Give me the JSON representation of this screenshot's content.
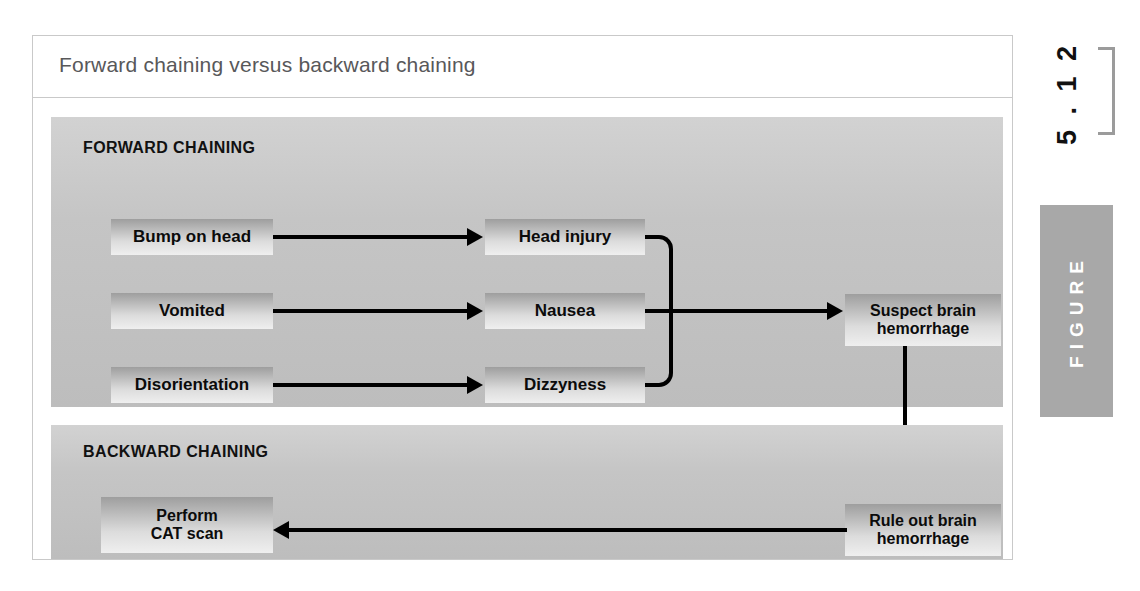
{
  "figure": {
    "caption": "Forward chaining versus backward chaining",
    "number_label": "5 . 1 2",
    "tab_label": "FIGURE"
  },
  "forward": {
    "title": "FORWARD CHAINING",
    "facts": [
      {
        "label": "Bump on head"
      },
      {
        "label": "Vomited"
      },
      {
        "label": "Disorientation"
      }
    ],
    "inferences": [
      {
        "label": "Head injury"
      },
      {
        "label": "Nausea"
      },
      {
        "label": "Dizzyness"
      }
    ],
    "conclusion": {
      "label": "Suspect brain\nhemorrhage"
    }
  },
  "backward": {
    "title": "BACKWARD CHAINING",
    "goal": {
      "label": "Rule out brain\nhemorrhage"
    },
    "action": {
      "label": "Perform\nCAT scan"
    }
  },
  "colors": {
    "panel_gray": "#c5c5c5",
    "tab_gray": "#a8a8a8",
    "caption_text": "#58585a",
    "connector": "#000000"
  }
}
